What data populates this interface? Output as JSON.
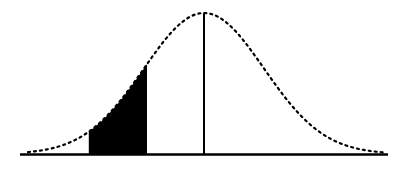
{
  "chart_data": {
    "type": "area",
    "title": "",
    "xlabel": "",
    "ylabel": "",
    "distribution": {
      "name": "normal",
      "mean": 0,
      "sd": 1
    },
    "x_range": [
      -3.1,
      3.1
    ],
    "mean_line": {
      "z": 0
    },
    "shaded_region": {
      "z_start": -1.92,
      "z_end": -0.95
    },
    "grid": false,
    "legend": false,
    "ticks": []
  },
  "style": {
    "curve_color": "#000000",
    "fill_color": "#000000",
    "baseline_color": "#000000",
    "background": "#ffffff"
  },
  "geometry": {
    "center_px": 204,
    "sigma_px": 60,
    "baseline_y": 154,
    "peak_y": 13,
    "axis_x_start": 20,
    "axis_x_end": 388
  }
}
